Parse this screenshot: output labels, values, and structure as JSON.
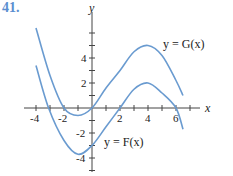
{
  "problem_number": "41.",
  "chart_data": {
    "type": "line",
    "title": "",
    "xlabel": "x",
    "ylabel": "y",
    "xlim": [
      -4.5,
      7.5
    ],
    "ylim": [
      -4.6,
      6.8
    ],
    "x_ticks": [
      -4,
      -2,
      2,
      4,
      6
    ],
    "y_ticks": [
      -4,
      -2,
      2,
      4
    ],
    "grid": false,
    "series": [
      {
        "name": "y = G(x)",
        "points": [
          [
            -4,
            6.4
          ],
          [
            -3,
            2.6
          ],
          [
            -2,
            0
          ],
          [
            -1,
            -0.6
          ],
          [
            0,
            0
          ],
          [
            1,
            1.6
          ],
          [
            2,
            3
          ],
          [
            3,
            4.5
          ],
          [
            4,
            5
          ],
          [
            5,
            4.2
          ],
          [
            6,
            2.2
          ],
          [
            6.5,
            1
          ]
        ],
        "color": "#6a9bd0"
      },
      {
        "name": "y = F(x)",
        "points": [
          [
            -4,
            3.4
          ],
          [
            -3.1,
            0
          ],
          [
            -2,
            -2.6
          ],
          [
            -1,
            -3.7
          ],
          [
            0,
            -3
          ],
          [
            1,
            -1.5
          ],
          [
            2,
            0
          ],
          [
            3,
            1.5
          ],
          [
            4,
            2
          ],
          [
            5,
            1.2
          ],
          [
            6,
            0
          ],
          [
            6.5,
            -1.7
          ]
        ],
        "color": "#6a9bd0"
      }
    ],
    "annotations": [
      "y = G(x)",
      "y = F(x)"
    ]
  },
  "labels": {
    "x_axis": "x",
    "y_axis": "y",
    "g_curve": "y = G(x)",
    "f_curve": "y = F(x)",
    "x_tick_values": [
      "-4",
      "-2",
      "2",
      "4",
      "6"
    ],
    "y_tick_values": [
      "4",
      "2",
      "-2",
      "-4"
    ]
  }
}
